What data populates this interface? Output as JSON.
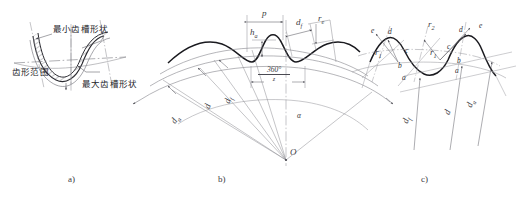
{
  "figure": {
    "background": "#ffffff",
    "line_color": "#3b3b42",
    "profile_color": "#1a1a1f"
  },
  "panels": [
    {
      "id": "a",
      "caption": "a)",
      "labels": {
        "min_groove": "最小齿槽形状",
        "profile_range": "齿形范围",
        "max_groove": "最大齿槽形状"
      }
    },
    {
      "id": "b",
      "caption": "b)",
      "dimensions": {
        "pitch": "p",
        "addendum": "h",
        "addendum_sub": "a",
        "root_dia": "d",
        "root_dia_sub": "f",
        "ref_dia": "d",
        "tip_dia": "d",
        "tip_dia_sub": "a",
        "edge_radius": "r",
        "edge_radius_sub": "e"
      },
      "angle": {
        "numerator": "360°",
        "denominator": "z",
        "alpha": "α"
      },
      "center_label": "O"
    },
    {
      "id": "c",
      "caption": "c)",
      "points_left": [
        "a",
        "b",
        "c",
        "d",
        "e"
      ],
      "points_right": [
        "a",
        "b",
        "c",
        "d",
        "e"
      ],
      "radii": [
        {
          "symbol": "r",
          "sub": "1"
        },
        {
          "symbol": "r",
          "sub": "2"
        }
      ],
      "dimensions": {
        "root_dia": "d",
        "root_dia_sub": "f",
        "ref_dia": "d",
        "tip_dia": "d",
        "tip_dia_sub": "a"
      }
    }
  ]
}
